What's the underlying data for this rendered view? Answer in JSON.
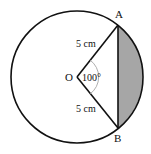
{
  "diagram": {
    "center_label": "O",
    "point_a_label": "A",
    "point_b_label": "B",
    "radius_label_top": "5 cm",
    "radius_label_bottom": "5 cm",
    "angle_label": "100°",
    "colors": {
      "stroke": "#111111",
      "segment_fill": "#a6a6a6",
      "angle_arc": "#999999"
    }
  }
}
